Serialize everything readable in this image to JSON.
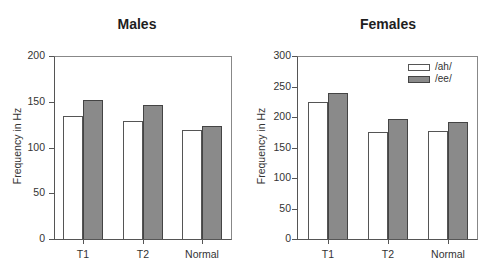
{
  "chart_data": [
    {
      "type": "bar",
      "title": "Males",
      "xlabel": "",
      "ylabel": "Frequency in Hz",
      "categories": [
        "T1",
        "T2",
        "Normal"
      ],
      "series": [
        {
          "name": "/ah/",
          "color": "#ffffff",
          "values": [
            134,
            129,
            119
          ]
        },
        {
          "name": "/ee/",
          "color": "#8a8a8a",
          "values": [
            152,
            146,
            123
          ]
        }
      ],
      "ylim": [
        0,
        200
      ],
      "yticks": [
        0,
        50,
        100,
        150,
        200
      ],
      "grid": false,
      "legend": null
    },
    {
      "type": "bar",
      "title": "Females",
      "xlabel": "",
      "ylabel": "Frequency in Hz",
      "categories": [
        "T1",
        "T2",
        "Normal"
      ],
      "series": [
        {
          "name": "/ah/",
          "color": "#ffffff",
          "values": [
            224,
            175,
            177
          ]
        },
        {
          "name": "/ee/",
          "color": "#8a8a8a",
          "values": [
            239,
            197,
            192
          ]
        }
      ],
      "ylim": [
        0,
        300
      ],
      "yticks": [
        0,
        50,
        100,
        150,
        200,
        250,
        300
      ],
      "grid": false,
      "legend": {
        "position": "upper right",
        "entries": [
          "/ah/",
          "/ee/"
        ]
      }
    }
  ]
}
